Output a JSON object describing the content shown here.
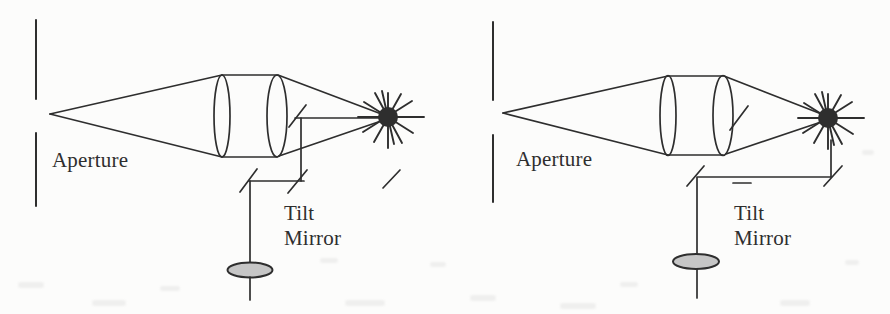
{
  "figure": {
    "colors": {
      "ink": "#2e2e2e",
      "paper": "#fcfcfb",
      "lens_fill": "#c6c6c6"
    },
    "panels": [
      {
        "id": "left",
        "aperture_label": "Aperture",
        "tilt_mirror_label": "Tilt\nMirror"
      },
      {
        "id": "right",
        "aperture_label": "Aperture",
        "tilt_mirror_label": "Tilt\nMirror"
      }
    ]
  }
}
